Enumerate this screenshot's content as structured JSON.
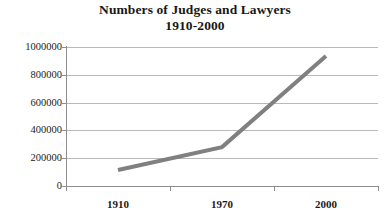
{
  "chart_data": {
    "type": "line",
    "title": "Numbers of Judges and Lawyers 1910-2000",
    "title_line1": "Numbers of Judges and Lawyers",
    "title_line2": "1910-2000",
    "xlabel": "",
    "ylabel": "",
    "categories": [
      "1910",
      "1970",
      "2000"
    ],
    "x": [
      1910,
      1970,
      2000
    ],
    "values": [
      115000,
      280000,
      935000
    ],
    "series": [
      {
        "name": "Judges and Lawyers",
        "values": [
          115000,
          280000,
          935000
        ]
      }
    ],
    "ylim": [
      0,
      1000000
    ],
    "ytick_labels": [
      "0",
      "200000",
      "400000",
      "600000",
      "800000",
      "1000000"
    ],
    "ytick_values": [
      0,
      200000,
      400000,
      600000,
      800000,
      1000000
    ],
    "xtick_labels": [
      "1910",
      "1970",
      "2000"
    ],
    "grid": true,
    "grid_axis": "y",
    "legend": false,
    "legend_position": "none",
    "colors": {
      "series_line": "#808080",
      "gridline": "#b9b9b9",
      "axis": "#8f8f8f",
      "text": "#1a1a1a",
      "background": "#ffffff"
    },
    "line_width": 4
  }
}
